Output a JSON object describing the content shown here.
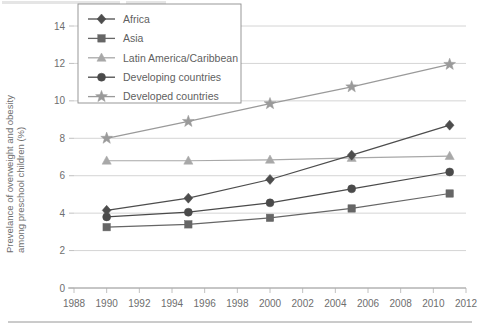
{
  "chart_data": {
    "type": "line",
    "title": "",
    "xlabel": "",
    "ylabel": "Prevelance of overweight and obesity among preschool children (%)",
    "xlim": [
      1988,
      2012
    ],
    "ylim": [
      0,
      14
    ],
    "grid": true,
    "legend_position": "top-left-inside",
    "x_ticks": [
      1988,
      1990,
      1992,
      1994,
      1996,
      1998,
      2000,
      2002,
      2004,
      2006,
      2008,
      2010,
      2012
    ],
    "y_ticks": [
      0,
      2,
      4,
      6,
      8,
      10,
      12,
      14
    ],
    "x": [
      1990,
      1995,
      2000,
      2005,
      2011
    ],
    "series": [
      {
        "name": "Africa",
        "marker": "diamond",
        "color": "#4d4d4d",
        "values": [
          4.15,
          4.8,
          5.8,
          7.1,
          8.7
        ]
      },
      {
        "name": "Asia",
        "marker": "square",
        "color": "#666666",
        "values": [
          3.25,
          3.4,
          3.75,
          4.25,
          5.05
        ]
      },
      {
        "name": "Latin America/Caribbean",
        "marker": "triangle",
        "color": "#a8a8a8",
        "values": [
          6.8,
          6.8,
          6.85,
          6.95,
          7.05
        ]
      },
      {
        "name": "Developing countries",
        "marker": "circle",
        "color": "#4a4a4a",
        "values": [
          3.8,
          4.05,
          4.55,
          5.3,
          6.2
        ]
      },
      {
        "name": "Developed countries",
        "marker": "star",
        "color": "#9a9a9a",
        "values": [
          8.0,
          8.9,
          9.85,
          10.75,
          11.95
        ]
      }
    ]
  },
  "axis": {
    "y_tick_labels": [
      "0",
      "2",
      "4",
      "6",
      "8",
      "10",
      "12",
      "14"
    ],
    "x_tick_labels": [
      "1988",
      "1990",
      "1992",
      "1994",
      "1996",
      "1998",
      "2000",
      "2002",
      "2004",
      "2006",
      "2008",
      "2010",
      "2012"
    ],
    "y_title_line1": "Prevelance of overweight and obesity",
    "y_title_line2": "among preschool children (%)"
  },
  "legend": {
    "items": [
      {
        "label": "Africa",
        "marker": "diamond",
        "color": "#4d4d4d"
      },
      {
        "label": "Asia",
        "marker": "square",
        "color": "#666666"
      },
      {
        "label": "Latin America/Caribbean",
        "marker": "triangle",
        "color": "#a8a8a8"
      },
      {
        "label": "Developing countries",
        "marker": "circle",
        "color": "#4a4a4a"
      },
      {
        "label": "Developed countries",
        "marker": "star",
        "color": "#9a9a9a"
      }
    ]
  },
  "colors": {
    "gridline": "#c9c9c9",
    "axis": "#9a9a9a",
    "text": "#6e6e6e",
    "background": "#ffffff"
  }
}
